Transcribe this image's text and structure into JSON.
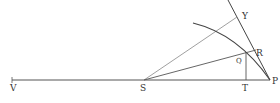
{
  "diagram": {
    "type": "geometric construction",
    "points": {
      "V": {
        "label": "V",
        "x": 12,
        "y": 80
      },
      "S": {
        "label": "S",
        "x": 144,
        "y": 80
      },
      "T": {
        "label": "T",
        "x": 246,
        "y": 80
      },
      "P": {
        "label": "P",
        "x": 270,
        "y": 80
      },
      "Q": {
        "label": "Q",
        "x": 246,
        "y": 52
      },
      "R": {
        "label": "R",
        "x": 256,
        "y": 50
      },
      "Y": {
        "label": "Y",
        "x": 237,
        "y": 17
      }
    },
    "labels": {
      "V": "V",
      "S": "S",
      "T": "T",
      "P": "P",
      "Q": "Q",
      "R": "R",
      "Y": "Y"
    },
    "colors": {
      "line": "#555555",
      "curve": "#444444",
      "faint_line": "#888888"
    }
  }
}
